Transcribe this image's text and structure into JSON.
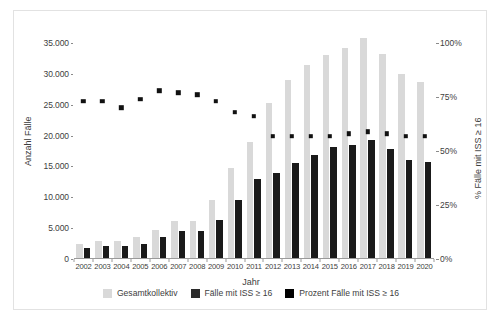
{
  "chart_data": {
    "type": "bar",
    "title": "",
    "xlabel": "Jahr",
    "ylabel": "Anzahl Fälle",
    "y2label": "% Fälle mit ISS ≥ 16",
    "ylim": [
      0,
      35000
    ],
    "y2lim": [
      0,
      100
    ],
    "grid": false,
    "legend_position": "bottom",
    "categories": [
      "2002",
      "2003",
      "2004",
      "2005",
      "2006",
      "2007",
      "2008",
      "2009",
      "2010",
      "2011",
      "2012",
      "2013",
      "2014",
      "2015",
      "2016",
      "2017",
      "2018",
      "2019",
      "2020"
    ],
    "yticks": [
      "0",
      "5.000",
      "10.000",
      "15.000",
      "20.000",
      "25.000",
      "30.000",
      "35.000"
    ],
    "ytick_values": [
      0,
      5000,
      10000,
      15000,
      20000,
      25000,
      30000,
      35000
    ],
    "y2ticks": [
      "0%",
      "25%",
      "50%",
      "75%",
      "100%"
    ],
    "y2tick_values": [
      0,
      25,
      50,
      75,
      100
    ],
    "series": [
      {
        "name": "Gesamtkollektiv",
        "axis": "left",
        "kind": "bar",
        "color": "#D9D9D9",
        "values": [
          2500,
          2900,
          2950,
          3600,
          4700,
          6100,
          6100,
          9500,
          14700,
          19000,
          25300,
          29000,
          31400,
          33000,
          34200,
          35800,
          33200,
          29900,
          28700
        ]
      },
      {
        "name": "Fälle mit ISS ≥ 16",
        "axis": "left",
        "kind": "bar",
        "color": "#1A1A1A",
        "values": [
          1800,
          2100,
          2050,
          2400,
          3500,
          4500,
          4500,
          6400,
          9500,
          13000,
          14000,
          15500,
          16900,
          18100,
          18500,
          19300,
          17900,
          16100,
          15700
        ]
      },
      {
        "name": "Prozent Fälle mit ISS ≥ 16",
        "axis": "right",
        "kind": "scatter",
        "color": "#111111",
        "values": [
          73,
          73,
          70,
          74,
          78,
          77,
          76,
          73,
          68,
          66,
          57,
          57,
          57,
          57,
          58,
          59,
          58,
          57,
          57
        ]
      }
    ]
  },
  "legend": {
    "items": [
      {
        "label": "Gesamtkollektiv",
        "color": "#D9D9D9"
      },
      {
        "label": "Fälle mit ISS ≥ 16",
        "color": "#2B2B2B"
      },
      {
        "label": "Prozent Fälle mit ISS ≥ 16",
        "color": "#000000"
      }
    ]
  }
}
